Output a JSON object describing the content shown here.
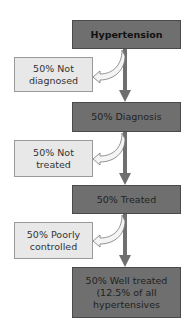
{
  "diagram": {
    "type": "flowchart",
    "colors": {
      "main_box": "#6f6f6f",
      "side_box": "#e8e8e8",
      "arrow": "#6f6f6f"
    },
    "main_steps": [
      {
        "label": "Hypertension"
      },
      {
        "label": "50% Diagnosis"
      },
      {
        "label": "50% Treated"
      },
      {
        "label": "50% Well treated (12.5% of all hypertensives"
      }
    ],
    "branches": [
      {
        "label": "50% Not diagnosed"
      },
      {
        "label": "50% Not treated"
      },
      {
        "label": "50% Poorly controlled"
      }
    ]
  }
}
